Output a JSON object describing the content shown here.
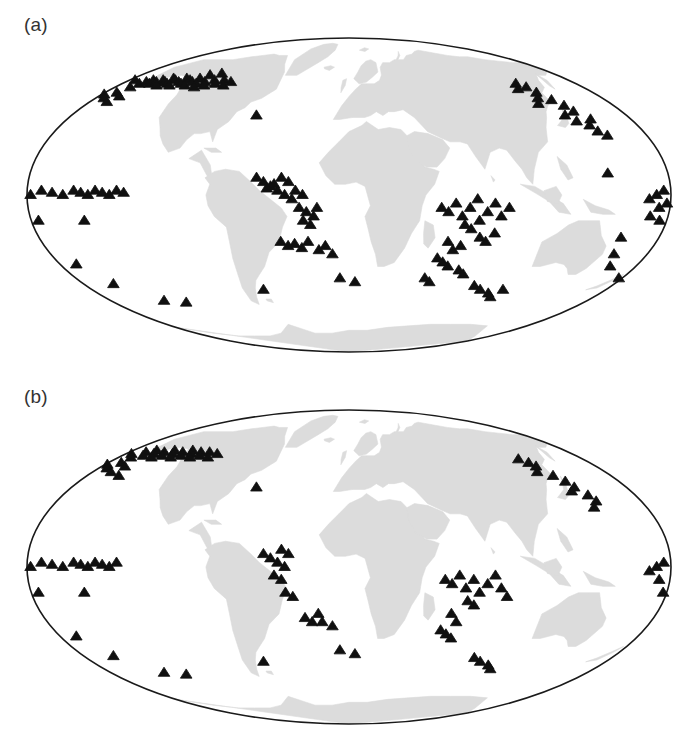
{
  "figure": {
    "background_color": "#ffffff",
    "marker_color": "#101010",
    "land_color": "#dcdcdc",
    "ocean_color": "#ffffff",
    "outline_color": "#1a1a1a"
  },
  "panels": [
    {
      "id": "a",
      "label": "(a)"
    },
    {
      "id": "b",
      "label": "(b)"
    }
  ],
  "chart_data": {
    "type": "scatter",
    "title": "",
    "subtitle": "",
    "xlabel": "",
    "ylabel": "",
    "projection": "Mollweide",
    "grid": false,
    "legend": null,
    "xlim": [
      -180,
      180
    ],
    "ylim": [
      -90,
      90
    ],
    "marker": "filled-triangle",
    "panels": [
      {
        "label": "(a)",
        "point_count": 131,
        "series": [
          {
            "name": "sites-a",
            "points": [
              [
                -175,
                57
              ],
              [
                -168,
                53
              ],
              [
                -166,
                55
              ],
              [
                -163,
                56
              ],
              [
                -160,
                57
              ],
              [
                -158,
                55
              ],
              [
                -155,
                56
              ],
              [
                -152,
                57
              ],
              [
                -150,
                54
              ],
              [
                -148,
                56
              ],
              [
                -146,
                58
              ],
              [
                -144,
                55
              ],
              [
                -142,
                57
              ],
              [
                -140,
                54
              ],
              [
                -137,
                56
              ],
              [
                -135,
                58
              ],
              [
                -133,
                55
              ],
              [
                -130,
                57
              ],
              [
                -128,
                54
              ],
              [
                -126,
                56
              ],
              [
                -124,
                58
              ],
              [
                -121,
                55
              ],
              [
                -119,
                53
              ],
              [
                -116,
                56
              ],
              [
                -113,
                54
              ],
              [
                -110,
                57
              ],
              [
                -106,
                55
              ],
              [
                -102,
                57
              ],
              [
                -98,
                54
              ],
              [
                -95,
                56
              ],
              [
                -178,
                49
              ],
              [
                -174,
                47
              ],
              [
                -171,
                50
              ],
              [
                -168,
                45
              ],
              [
                -165,
                48
              ],
              [
                -120,
                60
              ],
              [
                -112,
                61
              ],
              [
                -60,
                38
              ],
              [
                -178,
                0
              ],
              [
                -172,
                2
              ],
              [
                -166,
                1
              ],
              [
                -160,
                0
              ],
              [
                -154,
                2
              ],
              [
                -150,
                1
              ],
              [
                -146,
                0
              ],
              [
                -142,
                2
              ],
              [
                -138,
                1
              ],
              [
                -134,
                0
              ],
              [
                -130,
                2
              ],
              [
                -126,
                1
              ],
              [
                -176,
                -12
              ],
              [
                -150,
                -12
              ],
              [
                -170,
                -33
              ],
              [
                -160,
                -43
              ],
              [
                -140,
                -52
              ],
              [
                -125,
                -53
              ],
              [
                -60,
                -46
              ],
              [
                -52,
                8
              ],
              [
                -48,
                6
              ],
              [
                -44,
                4
              ],
              [
                -40,
                2
              ],
              [
                -36,
                0
              ],
              [
                -32,
                -2
              ],
              [
                -30,
                2
              ],
              [
                -26,
                0
              ],
              [
                -34,
                6
              ],
              [
                -38,
                8
              ],
              [
                -42,
                5
              ],
              [
                -46,
                3
              ],
              [
                -28,
                -6
              ],
              [
                -24,
                -8
              ],
              [
                -20,
                -10
              ],
              [
                -18,
                -6
              ],
              [
                -26,
                -12
              ],
              [
                -22,
                -14
              ],
              [
                -40,
                -22
              ],
              [
                -36,
                -24
              ],
              [
                -32,
                -23
              ],
              [
                -28,
                -25
              ],
              [
                -24,
                -22
              ],
              [
                -18,
                -26
              ],
              [
                -14,
                -24
              ],
              [
                -10,
                -28
              ],
              [
                -6,
                -40
              ],
              [
                4,
                -42
              ],
              [
                52,
                -6
              ],
              [
                56,
                -8
              ],
              [
                60,
                -4
              ],
              [
                64,
                -10
              ],
              [
                68,
                -6
              ],
              [
                72,
                -2
              ],
              [
                66,
                -14
              ],
              [
                70,
                -16
              ],
              [
                74,
                -12
              ],
              [
                78,
                -8
              ],
              [
                82,
                -4
              ],
              [
                86,
                -10
              ],
              [
                90,
                -6
              ],
              [
                76,
                -20
              ],
              [
                80,
                -22
              ],
              [
                84,
                -18
              ],
              [
                58,
                -22
              ],
              [
                62,
                -26
              ],
              [
                66,
                -24
              ],
              [
                54,
                -30
              ],
              [
                58,
                -32
              ],
              [
                62,
                -34
              ],
              [
                70,
                -36
              ],
              [
                74,
                -38
              ],
              [
                50,
                -40
              ],
              [
                54,
                -42
              ],
              [
                86,
                -44
              ],
              [
                92,
                -46
              ],
              [
                100,
                -48
              ],
              [
                104,
                -50
              ],
              [
                108,
                -46
              ],
              [
                130,
                44
              ],
              [
                134,
                47
              ],
              [
                138,
                50
              ],
              [
                142,
                46
              ],
              [
                146,
                43
              ],
              [
                140,
                38
              ],
              [
                144,
                35
              ],
              [
                148,
                40
              ],
              [
                150,
                33
              ],
              [
                152,
                30
              ],
              [
                154,
                36
              ],
              [
                156,
                28
              ],
              [
                128,
                52
              ],
              [
                132,
                55
              ],
              [
                136,
                53
              ],
              [
                168,
                -2
              ],
              [
                172,
                0
              ],
              [
                176,
                2
              ],
              [
                178,
                -4
              ],
              [
                174,
                -6
              ],
              [
                170,
                -10
              ],
              [
                176,
                -12
              ],
              [
                146,
                10
              ],
              [
                158,
                -20
              ],
              [
                160,
                -28
              ],
              [
                164,
                -34
              ],
              [
                178,
                -40
              ]
            ]
          }
        ]
      },
      {
        "label": "(b)",
        "point_count": 88,
        "series": [
          {
            "name": "sites-b",
            "points": [
              [
                -175,
                56
              ],
              [
                -170,
                54
              ],
              [
                -166,
                57
              ],
              [
                -163,
                55
              ],
              [
                -160,
                58
              ],
              [
                -157,
                56
              ],
              [
                -154,
                54
              ],
              [
                -151,
                57
              ],
              [
                -148,
                55
              ],
              [
                -145,
                58
              ],
              [
                -142,
                56
              ],
              [
                -139,
                54
              ],
              [
                -136,
                57
              ],
              [
                -133,
                55
              ],
              [
                -130,
                58
              ],
              [
                -127,
                56
              ],
              [
                -124,
                54
              ],
              [
                -121,
                57
              ],
              [
                -118,
                55
              ],
              [
                -114,
                57
              ],
              [
                -110,
                54
              ],
              [
                -106,
                56
              ],
              [
                -178,
                50
              ],
              [
                -174,
                48
              ],
              [
                -170,
                51
              ],
              [
                -167,
                46
              ],
              [
                -163,
                49
              ],
              [
                -158,
                44
              ],
              [
                -60,
                38
              ],
              [
                -178,
                0
              ],
              [
                -172,
                2
              ],
              [
                -166,
                1
              ],
              [
                -160,
                0
              ],
              [
                -154,
                2
              ],
              [
                -150,
                1
              ],
              [
                -146,
                0
              ],
              [
                -142,
                2
              ],
              [
                -138,
                1
              ],
              [
                -134,
                0
              ],
              [
                -130,
                2
              ],
              [
                -176,
                -12
              ],
              [
                -150,
                -12
              ],
              [
                -170,
                -33
              ],
              [
                -160,
                -43
              ],
              [
                -140,
                -52
              ],
              [
                -125,
                -53
              ],
              [
                -60,
                -46
              ],
              [
                -48,
                6
              ],
              [
                -44,
                4
              ],
              [
                -40,
                2
              ],
              [
                -36,
                0
              ],
              [
                -34,
                6
              ],
              [
                -38,
                8
              ],
              [
                -42,
                -4
              ],
              [
                -38,
                -6
              ],
              [
                -36,
                -12
              ],
              [
                -32,
                -14
              ],
              [
                -26,
                -24
              ],
              [
                -22,
                -26
              ],
              [
                -18,
                -22
              ],
              [
                -16,
                -26
              ],
              [
                -10,
                -28
              ],
              [
                -6,
                -40
              ],
              [
                4,
                -42
              ],
              [
                54,
                -6
              ],
              [
                58,
                -8
              ],
              [
                62,
                -4
              ],
              [
                66,
                -10
              ],
              [
                70,
                -6
              ],
              [
                74,
                -12
              ],
              [
                78,
                -8
              ],
              [
                82,
                -4
              ],
              [
                86,
                -10
              ],
              [
                68,
                -16
              ],
              [
                72,
                -18
              ],
              [
                90,
                -14
              ],
              [
                60,
                -22
              ],
              [
                64,
                -26
              ],
              [
                56,
                -30
              ],
              [
                60,
                -32
              ],
              [
                64,
                -34
              ],
              [
                86,
                -44
              ],
              [
                92,
                -46
              ],
              [
                100,
                -48
              ],
              [
                104,
                -50
              ],
              [
                132,
                46
              ],
              [
                136,
                49
              ],
              [
                140,
                44
              ],
              [
                144,
                41
              ],
              [
                142,
                36
              ],
              [
                146,
                38
              ],
              [
                150,
                34
              ],
              [
                152,
                31
              ],
              [
                148,
                28
              ],
              [
                130,
                53
              ],
              [
                134,
                51
              ],
              [
                168,
                -2
              ],
              [
                172,
                0
              ],
              [
                176,
                2
              ],
              [
                174,
                -6
              ],
              [
                178,
                -12
              ]
            ]
          }
        ]
      }
    ]
  }
}
